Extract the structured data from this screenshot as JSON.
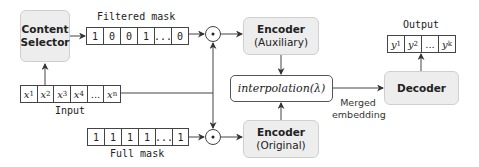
{
  "nodes": {
    "content_selector": {
      "line1": "Content",
      "line2": "Selector"
    },
    "encoder_aux": {
      "title": "Encoder",
      "subtitle": "(Auxiliary)"
    },
    "encoder_orig": {
      "title": "Encoder",
      "subtitle": "(Original)"
    },
    "interpolation": {
      "label": "interpolation(λ)"
    },
    "decoder": {
      "title": "Decoder"
    }
  },
  "arrays": {
    "filtered_mask": {
      "label": "Filtered mask",
      "cells": [
        "1",
        "0",
        "0",
        "1",
        "...",
        "0"
      ]
    },
    "full_mask": {
      "label": "Full mask",
      "cells": [
        "1",
        "1",
        "1",
        "1",
        "...",
        "1"
      ]
    },
    "input": {
      "label": "Input",
      "cells": [
        {
          "base": "x",
          "sub": "1"
        },
        {
          "base": "x",
          "sub": "2"
        },
        {
          "base": "x",
          "sub": "3"
        },
        {
          "base": "x",
          "sub": "4"
        },
        {
          "base": "...",
          "sub": ""
        },
        {
          "base": "x",
          "sub": "n"
        }
      ]
    },
    "output": {
      "label": "Output",
      "cells": [
        {
          "base": "y",
          "sub": "1"
        },
        {
          "base": "y",
          "sub": "2"
        },
        {
          "base": "...",
          "sub": ""
        },
        {
          "base": "y",
          "sub": "k"
        }
      ]
    }
  },
  "edge_labels": {
    "merged_line1": "Merged",
    "merged_line2": "embedding"
  },
  "operators": {
    "elementwise_product": "⊙"
  },
  "colors": {
    "box_fill": "#ededed",
    "box_border": "#cfcfcf",
    "line": "#444444"
  }
}
